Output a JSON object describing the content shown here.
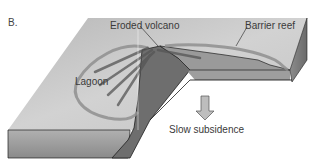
{
  "figure": {
    "panel_label": "B.",
    "labels": {
      "eroded_volcano": "Eroded volcano",
      "barrier_reef": "Barrier reef",
      "lagoon": "Lagoon",
      "slow_subsidence": "Slow subsidence"
    },
    "colors": {
      "top_surface": "#c9c9c9",
      "front_face": "#9a9a9a",
      "side_face": "#7d7d7d",
      "cross_section": "#6e6e6e",
      "reef_ring": "#8f8f8f",
      "outline": "#1e1e1e",
      "arrow_fill": "#bdbdbd",
      "text": "#3a3a3a"
    }
  }
}
